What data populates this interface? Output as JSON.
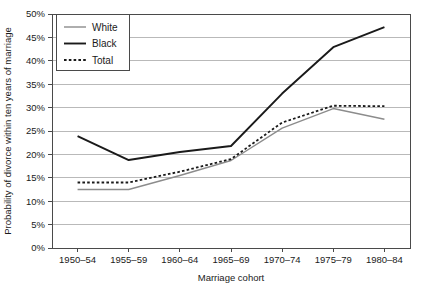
{
  "chart_data": {
    "type": "line",
    "title": "",
    "xlabel": "Marriage cohort",
    "ylabel": "Probability of divorce within ten years of marriage",
    "categories": [
      "1950–54",
      "1955–59",
      "1960–64",
      "1965–69",
      "1970–74",
      "1975–79",
      "1980–84"
    ],
    "ylim": [
      0,
      50
    ],
    "ytick_values": [
      0,
      5,
      10,
      15,
      20,
      25,
      30,
      35,
      40,
      45,
      50
    ],
    "ytick_labels": [
      "0%",
      "5%",
      "10%",
      "15%",
      "20%",
      "25%",
      "30%",
      "35%",
      "40%",
      "45%",
      "50%"
    ],
    "grid": "horizontal",
    "legend_position": "top-left",
    "series": [
      {
        "name": "White",
        "style": "solid",
        "color": "#8c8c8c",
        "width": 1.4,
        "values": [
          12.5,
          12.5,
          15.5,
          18.7,
          25.6,
          29.8,
          27.5
        ]
      },
      {
        "name": "Black",
        "style": "solid",
        "color": "#1a1a1a",
        "width": 1.9,
        "values": [
          23.9,
          18.8,
          20.5,
          21.8,
          33.0,
          42.9,
          47.2
        ]
      },
      {
        "name": "Total",
        "style": "dotted",
        "color": "#1a1a1a",
        "width": 1.8,
        "values": [
          14.0,
          14.0,
          16.3,
          19.0,
          26.8,
          30.4,
          30.3
        ]
      }
    ]
  },
  "legend": {
    "entries": [
      "White",
      "Black",
      "Total"
    ]
  },
  "axes": {
    "x_title": "Marriage cohort",
    "y_title": "Probability of divorce within ten years of marriage"
  }
}
